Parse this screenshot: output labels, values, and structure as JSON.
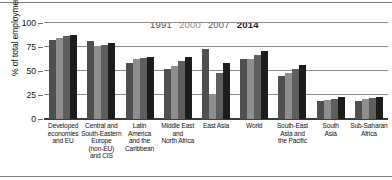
{
  "chart_data": {
    "type": "bar",
    "title": "",
    "xlabel": "",
    "ylabel": "% of total employment",
    "ylim": [
      0,
      100
    ],
    "yticks": [
      0,
      25,
      50,
      75,
      100
    ],
    "grid": true,
    "legend_position": "top-center",
    "categories": [
      "Developed economies and EU",
      "Central and South-Eastern Europe (non-EU) and CIS",
      "Latin America and the Caribbean",
      "Middle East and North Africa",
      "East Asia",
      "World",
      "South-East Asia and the Pacific",
      "South Asia",
      "Sub-Saharan Africa"
    ],
    "series": [
      {
        "name": "1991",
        "color": "#4f4f4f",
        "values": [
          82,
          81,
          58,
          52,
          73,
          62,
          45,
          19,
          19
        ]
      },
      {
        "name": "2000",
        "color": "#8e8e8e",
        "values": [
          84,
          75,
          62,
          55,
          25,
          63,
          48,
          20,
          21
        ]
      },
      {
        "name": "2007",
        "color": "#5e5e5e",
        "values": [
          86,
          77,
          64,
          60,
          48,
          67,
          52,
          21,
          22
        ]
      },
      {
        "name": "2014",
        "color": "#1c1c1c",
        "values": [
          88,
          79,
          65,
          65,
          58,
          71,
          56,
          23,
          23
        ]
      }
    ]
  },
  "axis": {
    "y_title": "% of total employment",
    "tick_labels": [
      "100",
      "75",
      "50",
      "25",
      "0"
    ]
  },
  "legend": {
    "items": [
      {
        "label": "1991",
        "color": "#4f4f4f"
      },
      {
        "label": "2000",
        "color": "#8e8e8e"
      },
      {
        "label": "2007",
        "color": "#5e5e5e"
      },
      {
        "label": "2014",
        "color": "#1c1c1c"
      }
    ]
  },
  "category_labels": [
    [
      "Developed",
      "economies",
      "and EU"
    ],
    [
      "Central and",
      "South-Eastern",
      "Europe",
      "(non-EU)",
      "and CIS"
    ],
    [
      "Latin",
      "America",
      "and the",
      "Caribbean"
    ],
    [
      "Middle East",
      "and",
      "North Africa"
    ],
    [
      "East Asia"
    ],
    [
      "World"
    ],
    [
      "South-East",
      "Asia and",
      "the Pacific"
    ],
    [
      "South",
      "Asia"
    ],
    [
      "Sub-Saharan",
      "Africa"
    ]
  ]
}
